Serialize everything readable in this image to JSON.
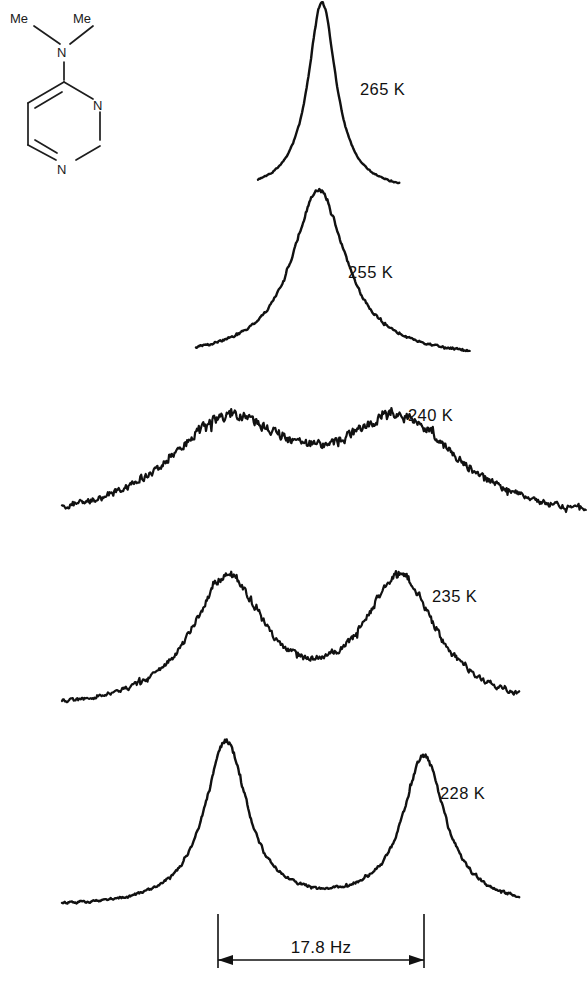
{
  "figure": {
    "type": "nmr-variable-temperature-stack",
    "background_color": "#ffffff",
    "trace_color": "#111111",
    "width": 588,
    "height": 984
  },
  "structure": {
    "name": "4-(dimethylamino)pyrimidine",
    "labels": {
      "methyl_left": "Me",
      "methyl_right": "Me",
      "amine_nitrogen": "N",
      "ring_nitrogen_1": "N",
      "ring_nitrogen_3": "N"
    }
  },
  "scale_bar": {
    "label": "17.8 Hz",
    "value": 17.8,
    "unit": "Hz",
    "left_tick_x": 218,
    "right_tick_x": 424
  },
  "spectra": [
    {
      "temperature_label": "265 K",
      "temperature_k": 265,
      "regime": "fast-exchange-sharp-singlet"
    },
    {
      "temperature_label": "255 K",
      "temperature_k": 255,
      "regime": "broadened-singlet"
    },
    {
      "temperature_label": "240 K",
      "temperature_k": 240,
      "regime": "coalescence-flat-top"
    },
    {
      "temperature_label": "235 K",
      "temperature_k": 235,
      "regime": "resolving-doublet"
    },
    {
      "temperature_label": "228 K",
      "temperature_k": 228,
      "regime": "slow-exchange-doublet"
    }
  ],
  "chart_data": {
    "type": "line",
    "title": "",
    "xlabel": "",
    "ylabel": "",
    "grid": false,
    "legend_position": "inline-right",
    "x_axis_units": "Hz (relative frequency)",
    "peak_separation_hz": 17.8,
    "series": [
      {
        "name": "265 K",
        "label_x": 360,
        "label_y": 95,
        "baseline_y": 192,
        "x_start": 258,
        "x_end": 400,
        "peaks": [
          {
            "center_x": 322,
            "height": 190,
            "half_width": 17
          }
        ],
        "noise": 0.9,
        "stroke_width": 2.4
      },
      {
        "name": "255 K",
        "label_x": 348,
        "label_y": 278,
        "baseline_y": 358,
        "x_start": 196,
        "x_end": 470,
        "peaks": [
          {
            "center_x": 319,
            "height": 168,
            "half_width": 33
          }
        ],
        "noise": 1.5,
        "stroke_width": 2.4
      },
      {
        "name": "240 K",
        "label_x": 408,
        "label_y": 421,
        "baseline_y": 527,
        "x_start": 62,
        "x_end": 586,
        "peaks": [
          {
            "center_x": 228,
            "height": 112,
            "half_width": 74
          },
          {
            "center_x": 400,
            "height": 112,
            "half_width": 74
          }
        ],
        "noise": 3.4,
        "stroke_width": 2.2
      },
      {
        "name": "235 K",
        "label_x": 432,
        "label_y": 602,
        "baseline_y": 712,
        "x_start": 62,
        "x_end": 520,
        "peaks": [
          {
            "center_x": 228,
            "height": 138,
            "half_width": 44
          },
          {
            "center_x": 400,
            "height": 138,
            "half_width": 44
          }
        ],
        "noise": 3.0,
        "stroke_width": 2.2
      },
      {
        "name": "228 K",
        "label_x": 440,
        "label_y": 799,
        "baseline_y": 908,
        "x_start": 62,
        "x_end": 520,
        "peaks": [
          {
            "center_x": 226,
            "height": 168,
            "half_width": 26
          },
          {
            "center_x": 424,
            "height": 152,
            "half_width": 26
          }
        ],
        "noise": 1.8,
        "stroke_width": 2.4
      }
    ]
  }
}
